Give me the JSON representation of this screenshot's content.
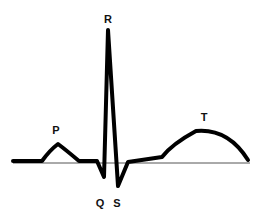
{
  "diagram": {
    "labels": {
      "p": "P",
      "q": "Q",
      "r": "R",
      "s": "S",
      "t": "T"
    },
    "colors": {
      "trace": "#000000",
      "baseline": "#555555",
      "background": "#ffffff"
    }
  }
}
